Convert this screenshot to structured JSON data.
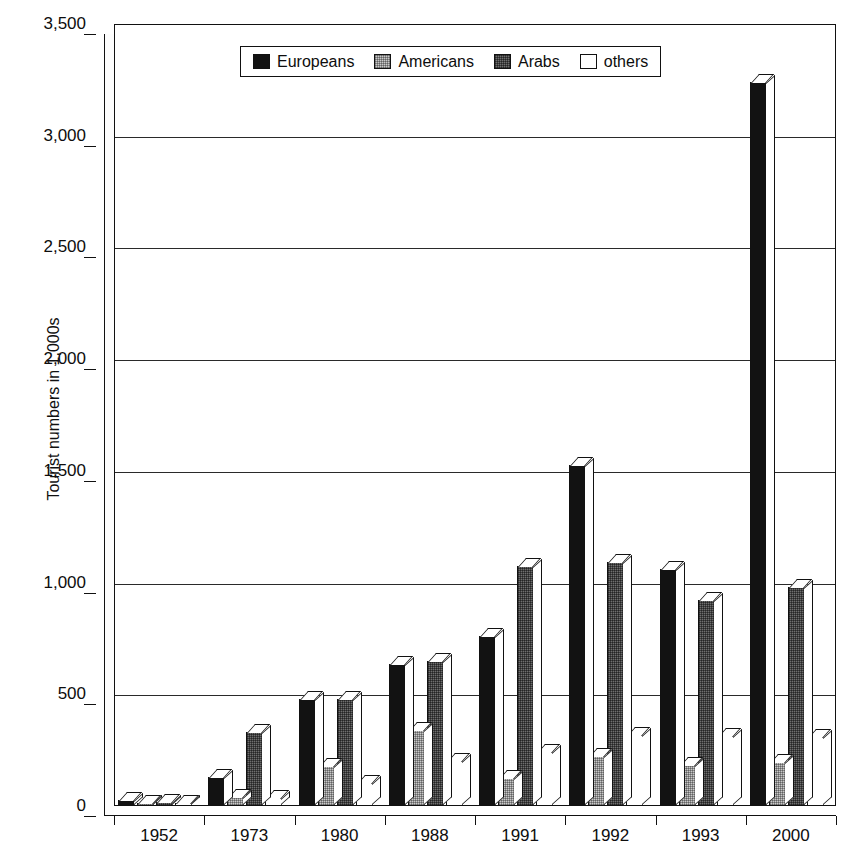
{
  "chart_data": {
    "type": "bar",
    "title": "",
    "xlabel": "",
    "ylabel": "Tourist numbers in 1,000s",
    "ylim": [
      0,
      3500
    ],
    "ytick_step": 500,
    "ytick_labels": [
      "3,500",
      "3,000",
      "2,500",
      "2,000",
      "1,500",
      "1,000",
      "500",
      "0"
    ],
    "ytick_values": [
      3500,
      3000,
      2500,
      2000,
      1500,
      1000,
      500,
      0
    ],
    "grid": true,
    "legend_position": "top-center",
    "style": "3d-clustered-column",
    "categories": [
      "1952",
      "1973",
      "1980",
      "1988",
      "1991",
      "1992",
      "1993",
      "2000"
    ],
    "series": [
      {
        "name": "Europeans",
        "color": "#121212",
        "pattern": "solid-black",
        "values": [
          25,
          130,
          480,
          635,
          760,
          1525,
          1060,
          3240
        ]
      },
      {
        "name": "Americans",
        "color": "#c9c9c9",
        "pattern": "light-dots",
        "values": [
          12,
          40,
          180,
          340,
          125,
          225,
          185,
          195
        ]
      },
      {
        "name": "Arabs",
        "color": "#6f6f6f",
        "pattern": "dark-dots",
        "values": [
          20,
          330,
          480,
          650,
          1075,
          1090,
          920,
          980
        ]
      },
      {
        "name": "others",
        "color": "#ffffff",
        "pattern": "white",
        "values": [
          10,
          35,
          105,
          200,
          240,
          320,
          315,
          310
        ]
      }
    ]
  },
  "legend": {
    "items": [
      {
        "label": "Europeans"
      },
      {
        "label": "Americans"
      },
      {
        "label": "Arabs"
      },
      {
        "label": "others"
      }
    ]
  }
}
